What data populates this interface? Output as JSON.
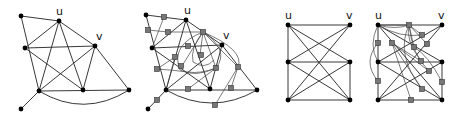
{
  "figure": {
    "panels": [
      {
        "id": "graph-1",
        "description": "Original graph with vertices u and v",
        "labels": {
          "u": "u",
          "v": "v"
        }
      },
      {
        "id": "graph-2",
        "description": "Graph 1 with subdivision (dummy) vertices shown as gray squares and additional curved edges",
        "labels": {
          "u": "u",
          "v": "v"
        }
      },
      {
        "id": "graph-3",
        "description": "Bipartite-like 3x2 grid graph with crossing edges",
        "labels": {
          "u": "u",
          "v": "v"
        }
      },
      {
        "id": "graph-4",
        "description": "Graph 3 with subdivision vertices shown as gray squares and curved edges",
        "labels": {
          "u": "u",
          "v": "v"
        }
      }
    ],
    "legend": {
      "vertex": "black dot",
      "subdivision_vertex": "gray square"
    },
    "colors": {
      "vertex": "#000000",
      "subdivision": "#777777",
      "edge": "#222222"
    }
  }
}
